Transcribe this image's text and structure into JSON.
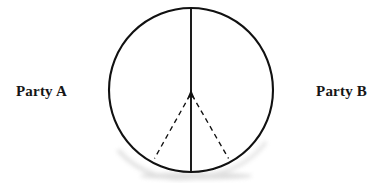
{
  "diagram": {
    "title_visible": false,
    "labels": {
      "left": "Party A",
      "right": "Party B"
    },
    "shapes": {
      "circle": {
        "name": "bargaining-set-circle",
        "center_x": 191,
        "center_y": 90,
        "radius": 82,
        "stroke": "#111111",
        "stroke_width": 2.1,
        "fill": "#ffffff",
        "style": "solid"
      },
      "divider_line": {
        "name": "vertical-divider",
        "x1": 191,
        "y1": 8,
        "x2": 191,
        "y2": 172,
        "stroke": "#111111",
        "stroke_width": 1.8,
        "style": "solid"
      },
      "arrow_head": {
        "name": "upward-arrowhead",
        "tip_x": 191,
        "tip_y": 91,
        "width": 8,
        "height": 11,
        "fill": "#111111"
      },
      "dashed_left": {
        "name": "wedge-edge-left",
        "x1": 191,
        "y1": 95,
        "x2": 154,
        "y2": 159,
        "stroke": "#111111",
        "stroke_width": 1.3,
        "style": "dashed",
        "dash_pattern": "5 4"
      },
      "dashed_right": {
        "name": "wedge-edge-right",
        "x1": 191,
        "y1": 95,
        "x2": 229,
        "y2": 159,
        "stroke": "#111111",
        "stroke_width": 1.3,
        "style": "dashed",
        "dash_pattern": "5 4"
      },
      "shadow": {
        "name": "scan-shadow-smudge",
        "color": "#b8b8b8"
      }
    },
    "colors": {
      "ink": "#111111",
      "text": "#161616",
      "background": "#ffffff",
      "smudge": "#b8b8b8"
    }
  }
}
